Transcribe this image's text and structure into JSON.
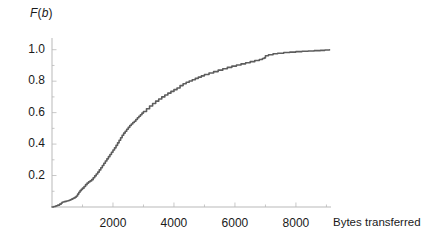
{
  "chart_data": {
    "type": "line",
    "subtype": "empirical-cdf-step",
    "title": "",
    "subtitle": "",
    "xlabel": "Bytes transferred",
    "ylabel": "F(b)",
    "ylabel_parts": {
      "func": "F",
      "open": "(",
      "var": "b",
      "close": ")"
    },
    "grid": false,
    "legend": null,
    "legend_position": "none",
    "xlim": [
      0,
      9150
    ],
    "ylim": [
      0,
      1.03
    ],
    "xticks": [
      2000,
      4000,
      6000,
      8000
    ],
    "xticklabels": [
      "2000",
      "4000",
      "6000",
      "8000"
    ],
    "xminorticks": [
      1000,
      3000,
      5000,
      7000,
      9000
    ],
    "yticks": [
      0.2,
      0.4,
      0.6,
      0.8,
      1.0
    ],
    "yticklabels": [
      "0.2",
      "0.4",
      "0.6",
      "0.8",
      "1.0"
    ],
    "yminorticks": [
      0.1,
      0.3,
      0.5,
      0.7,
      0.9
    ],
    "series": [
      {
        "name": "F(b)",
        "color": "#5d5d5d",
        "linewidth": 1.6,
        "x": [
          0,
          60,
          130,
          190,
          250,
          300,
          330,
          360,
          400,
          440,
          480,
          520,
          560,
          600,
          640,
          680,
          720,
          760,
          800,
          840,
          880,
          920,
          960,
          1000,
          1050,
          1100,
          1150,
          1200,
          1250,
          1300,
          1350,
          1400,
          1450,
          1500,
          1550,
          1600,
          1650,
          1700,
          1750,
          1800,
          1850,
          1900,
          1950,
          2000,
          2050,
          2100,
          2150,
          2200,
          2250,
          2300,
          2350,
          2400,
          2450,
          2500,
          2550,
          2600,
          2650,
          2700,
          2750,
          2800,
          2850,
          2900,
          2950,
          3000,
          3100,
          3200,
          3300,
          3400,
          3500,
          3600,
          3700,
          3800,
          3900,
          4000,
          4100,
          4200,
          4300,
          4400,
          4500,
          4600,
          4700,
          4800,
          4900,
          5000,
          5150,
          5300,
          5450,
          5600,
          5750,
          5900,
          6050,
          6200,
          6350,
          6500,
          6650,
          6800,
          6900,
          6960,
          7000,
          7100,
          7250,
          7400,
          7600,
          7800,
          8000,
          8200,
          8400,
          8600,
          8800,
          8950,
          9100
        ],
        "y": [
          0.0,
          0.003,
          0.008,
          0.012,
          0.018,
          0.024,
          0.03,
          0.032,
          0.034,
          0.036,
          0.038,
          0.04,
          0.043,
          0.046,
          0.05,
          0.054,
          0.058,
          0.063,
          0.07,
          0.082,
          0.094,
          0.104,
          0.112,
          0.12,
          0.13,
          0.142,
          0.152,
          0.16,
          0.166,
          0.174,
          0.186,
          0.198,
          0.21,
          0.222,
          0.236,
          0.25,
          0.264,
          0.278,
          0.292,
          0.306,
          0.32,
          0.334,
          0.348,
          0.362,
          0.376,
          0.392,
          0.408,
          0.424,
          0.44,
          0.456,
          0.47,
          0.482,
          0.494,
          0.506,
          0.518,
          0.528,
          0.537,
          0.545,
          0.556,
          0.567,
          0.577,
          0.587,
          0.597,
          0.607,
          0.625,
          0.642,
          0.658,
          0.673,
          0.687,
          0.7,
          0.712,
          0.724,
          0.735,
          0.746,
          0.757,
          0.772,
          0.784,
          0.793,
          0.801,
          0.809,
          0.818,
          0.826,
          0.834,
          0.842,
          0.852,
          0.861,
          0.87,
          0.879,
          0.888,
          0.896,
          0.903,
          0.91,
          0.917,
          0.924,
          0.931,
          0.938,
          0.944,
          0.948,
          0.962,
          0.968,
          0.974,
          0.978,
          0.982,
          0.985,
          0.988,
          0.99,
          0.992,
          0.994,
          0.996,
          0.998,
          1.0
        ]
      }
    ],
    "annotations": [],
    "notes_visible": []
  },
  "axis_style": {
    "axis_color": "#b9b9b9",
    "tick_color": "#c8c8c8",
    "text_color": "#1a1a1a",
    "background": "#ffffff"
  }
}
